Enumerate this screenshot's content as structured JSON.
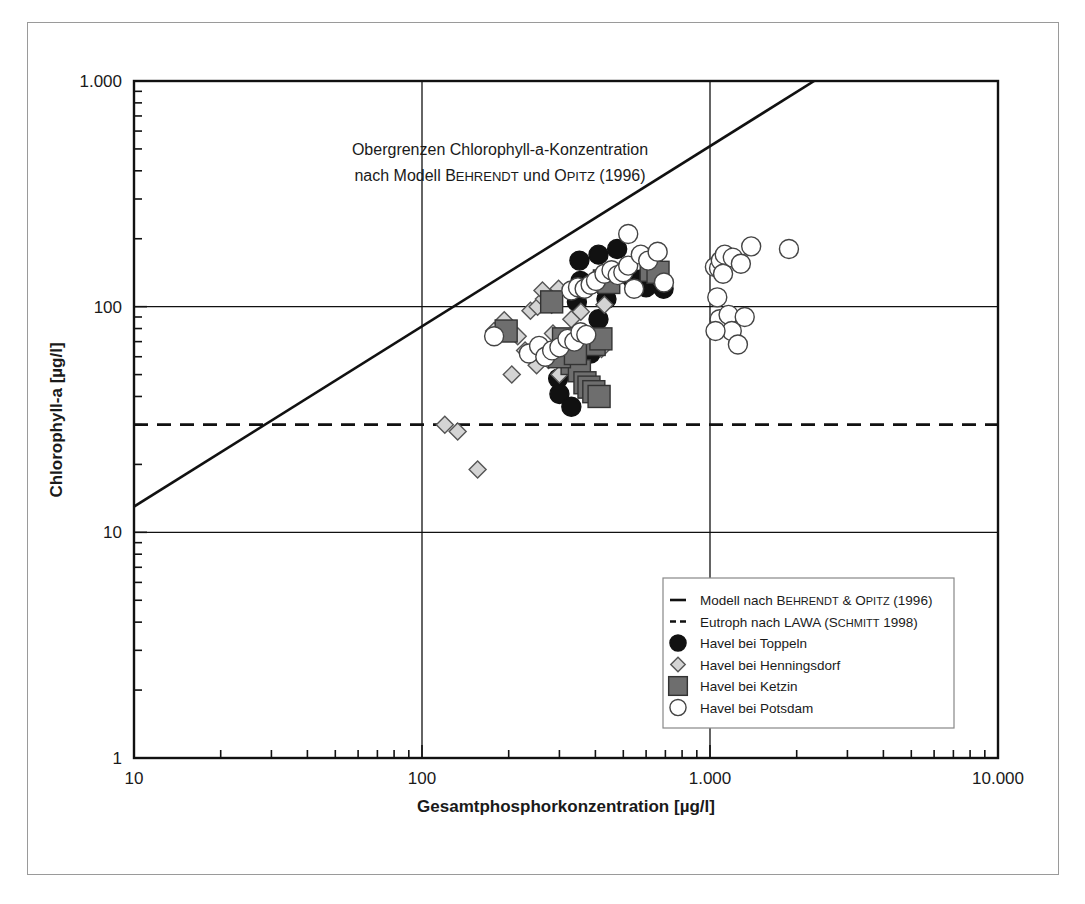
{
  "figure": {
    "background": "#ffffff",
    "frame_color": "#9a9a9a"
  },
  "chart_data": {
    "type": "scatter",
    "title": "",
    "xlabel": "Gesamtphosphorkonzentration [µg/l]",
    "ylabel": "Chlorophyll-a [µg/l]",
    "xscale": "log",
    "yscale": "log",
    "xlim": [
      10,
      10000
    ],
    "ylim": [
      1,
      1000
    ],
    "grid": true,
    "xticks": [
      10,
      100,
      1000,
      10000
    ],
    "xticklabels": [
      "10",
      "100",
      "1.000",
      "10.000"
    ],
    "yticks": [
      1,
      10,
      100,
      1000
    ],
    "yticklabels": [
      "1",
      "10",
      "100",
      "1.000"
    ],
    "annotation": {
      "line1": "Obergrenzen Chlorophyll-a-Konzentration",
      "line2_a": "nach Modell ",
      "line2_smallcaps_1": "B",
      "line2_smallcaps_1_rest": "EHRENDT",
      "line2_b": " und ",
      "line2_smallcaps_2": "O",
      "line2_smallcaps_2_rest": "PITZ",
      "line2_c": " (1996)"
    },
    "model_line": {
      "name": "Modell nach Behrendt & Opitz (1996)",
      "style": "solid",
      "color": "#111111",
      "p1": [
        10,
        13
      ],
      "p2": [
        2300,
        1000
      ]
    },
    "threshold_line": {
      "name": "Eutroph nach LAWA (Schmitt 1998)",
      "style": "dashed",
      "color": "#111111",
      "y_value": 30
    },
    "series": [
      {
        "name": "Havel bei Toppeln",
        "marker": "circle-filled",
        "fill": "#111111",
        "edge": "#111111",
        "points": [
          [
            352,
            160
          ],
          [
            410,
            170
          ],
          [
            476,
            180
          ],
          [
            537,
            133
          ],
          [
            575,
            132
          ],
          [
            600,
            122
          ],
          [
            660,
            126
          ],
          [
            690,
            120
          ],
          [
            312,
            68
          ],
          [
            297,
            48
          ],
          [
            300,
            41
          ],
          [
            330,
            58
          ],
          [
            385,
            62
          ],
          [
            330,
            36
          ],
          [
            410,
            88
          ],
          [
            355,
            130
          ],
          [
            437,
            108
          ],
          [
            345,
            105
          ]
        ]
      },
      {
        "name": "Havel bei Henningsdorf",
        "marker": "diamond",
        "fill": "#d4d4d4",
        "edge": "#555555",
        "points": [
          [
            120,
            30
          ],
          [
            133,
            28
          ],
          [
            156,
            19
          ],
          [
            178,
            78
          ],
          [
            193,
            87
          ],
          [
            215,
            74
          ],
          [
            238,
            96
          ],
          [
            252,
            100
          ],
          [
            265,
            108
          ],
          [
            282,
            102
          ],
          [
            285,
            76
          ],
          [
            300,
            70
          ],
          [
            318,
            72
          ],
          [
            332,
            68
          ],
          [
            348,
            74
          ],
          [
            362,
            66
          ],
          [
            393,
            70
          ],
          [
            420,
            65
          ],
          [
            300,
            50
          ],
          [
            275,
            58
          ],
          [
            250,
            55
          ],
          [
            330,
            88
          ],
          [
            356,
            95
          ],
          [
            205,
            50
          ],
          [
            228,
            64
          ],
          [
            430,
            102
          ],
          [
            676,
            128
          ],
          [
            262,
            118
          ],
          [
            298,
            120
          ]
        ]
      },
      {
        "name": "Havel bei Ketzin",
        "marker": "square",
        "fill": "#6e6e6e",
        "edge": "#333333",
        "points": [
          [
            196,
            78
          ],
          [
            282,
            105
          ],
          [
            310,
            72
          ],
          [
            332,
            56
          ],
          [
            352,
            52
          ],
          [
            368,
            46
          ],
          [
            380,
            44
          ],
          [
            396,
            68
          ],
          [
            418,
            72
          ],
          [
            395,
            42
          ],
          [
            412,
            40
          ],
          [
            430,
            130
          ],
          [
            445,
            128
          ],
          [
            625,
            145
          ],
          [
            660,
            142
          ],
          [
            300,
            60
          ],
          [
            341,
            62
          ]
        ]
      },
      {
        "name": "Havel bei Potsdam",
        "marker": "circle-open",
        "fill": "#ffffff",
        "edge": "#444444",
        "points": [
          [
            178,
            74
          ],
          [
            235,
            62
          ],
          [
            255,
            67
          ],
          [
            268,
            60
          ],
          [
            283,
            64
          ],
          [
            300,
            66
          ],
          [
            320,
            72
          ],
          [
            338,
            70
          ],
          [
            355,
            77
          ],
          [
            372,
            75
          ],
          [
            330,
            118
          ],
          [
            348,
            122
          ],
          [
            367,
            120
          ],
          [
            385,
            125
          ],
          [
            402,
            130
          ],
          [
            430,
            140
          ],
          [
            455,
            145
          ],
          [
            478,
            138
          ],
          [
            500,
            142
          ],
          [
            520,
            152
          ],
          [
            545,
            120
          ],
          [
            575,
            170
          ],
          [
            520,
            210
          ],
          [
            610,
            160
          ],
          [
            658,
            175
          ],
          [
            692,
            128
          ],
          [
            1040,
            150
          ],
          [
            1075,
            148
          ],
          [
            1090,
            160
          ],
          [
            1110,
            140
          ],
          [
            1125,
            170
          ],
          [
            1200,
            165
          ],
          [
            1280,
            155
          ],
          [
            1390,
            185
          ],
          [
            1060,
            110
          ],
          [
            1080,
            88
          ],
          [
            1160,
            92
          ],
          [
            1190,
            78
          ],
          [
            1250,
            68
          ],
          [
            1880,
            180
          ],
          [
            1320,
            90
          ],
          [
            1045,
            78
          ]
        ]
      }
    ]
  },
  "legend": {
    "entries": [
      {
        "type": "line-solid",
        "text_a": "Modell nach ",
        "sc1": "B",
        "sc1r": "EHRENDT",
        "mid": " & ",
        "sc2": "O",
        "sc2r": "PITZ",
        "text_b": " (1996)"
      },
      {
        "type": "line-dashed",
        "text_a": "Eutroph nach LAWA (",
        "sc1": "S",
        "sc1r": "CHMITT",
        "text_b": " 1998)"
      },
      {
        "type": "circle-filled",
        "label": "Havel bei Toppeln"
      },
      {
        "type": "diamond",
        "label": "Havel bei Henningsdorf"
      },
      {
        "type": "square",
        "label": "Havel bei Ketzin"
      },
      {
        "type": "circle-open",
        "label": "Havel bei Potsdam"
      }
    ]
  }
}
